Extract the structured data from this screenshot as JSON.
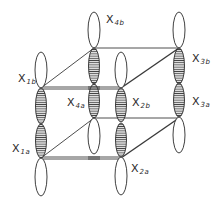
{
  "diagram": {
    "title": "",
    "colors": {
      "line": "#3a3a3a",
      "hatch": "#555555",
      "background": "#ffffff"
    },
    "labels": {
      "x4b": {
        "main": "X",
        "sub": "4b"
      },
      "x1b": {
        "main": "X",
        "sub": "1b"
      },
      "x3b": {
        "main": "X",
        "sub": "3b"
      },
      "x4a": {
        "main": "X",
        "sub": "4a"
      },
      "x2b": {
        "main": "X",
        "sub": "2b"
      },
      "x3a": {
        "main": "X",
        "sub": "3a"
      },
      "x1a": {
        "main": "X",
        "sub": "1a"
      },
      "x2a": {
        "main": "X",
        "sub": "2a"
      }
    }
  }
}
